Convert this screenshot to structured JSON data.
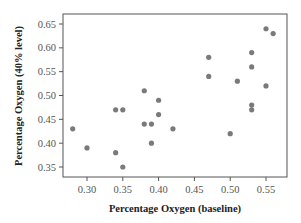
{
  "chart_data": {
    "type": "scatter",
    "title": "",
    "xlabel": "Percentage Oxygen (baseline)",
    "ylabel": "Percentage Oxygen (40% level)",
    "xlim": [
      0.27,
      0.575
    ],
    "ylim": [
      0.335,
      0.665
    ],
    "xticks": [
      0.3,
      0.35,
      0.4,
      0.45,
      0.5,
      0.55
    ],
    "xtick_labels": [
      "0.30",
      "0.35",
      "0.40",
      "0.45",
      "0.50",
      "0.55"
    ],
    "yticks": [
      0.35,
      0.4,
      0.45,
      0.5,
      0.55,
      0.6,
      0.65
    ],
    "ytick_labels": [
      "0.35",
      "0.40",
      "0.45",
      "0.50",
      "0.55",
      "0.60",
      "0.65"
    ],
    "grid": false,
    "legend": null,
    "point_color": "#7a7a7a",
    "points": [
      {
        "x": 0.28,
        "y": 0.43
      },
      {
        "x": 0.3,
        "y": 0.39
      },
      {
        "x": 0.34,
        "y": 0.47
      },
      {
        "x": 0.35,
        "y": 0.47
      },
      {
        "x": 0.34,
        "y": 0.38
      },
      {
        "x": 0.35,
        "y": 0.35
      },
      {
        "x": 0.38,
        "y": 0.51
      },
      {
        "x": 0.38,
        "y": 0.44
      },
      {
        "x": 0.39,
        "y": 0.44
      },
      {
        "x": 0.39,
        "y": 0.4
      },
      {
        "x": 0.4,
        "y": 0.49
      },
      {
        "x": 0.4,
        "y": 0.46
      },
      {
        "x": 0.42,
        "y": 0.43
      },
      {
        "x": 0.47,
        "y": 0.58
      },
      {
        "x": 0.47,
        "y": 0.54
      },
      {
        "x": 0.5,
        "y": 0.42
      },
      {
        "x": 0.51,
        "y": 0.53
      },
      {
        "x": 0.53,
        "y": 0.59
      },
      {
        "x": 0.53,
        "y": 0.56
      },
      {
        "x": 0.53,
        "y": 0.48
      },
      {
        "x": 0.53,
        "y": 0.47
      },
      {
        "x": 0.55,
        "y": 0.64
      },
      {
        "x": 0.56,
        "y": 0.63
      },
      {
        "x": 0.55,
        "y": 0.52
      }
    ]
  }
}
